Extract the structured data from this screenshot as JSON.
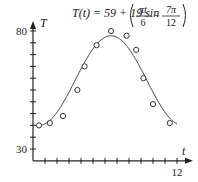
{
  "chart_data": {
    "type": "scatter",
    "title": "",
    "xlabel": "t",
    "ylabel": "T",
    "xlim": [
      0,
      12
    ],
    "ylim": [
      25,
      80
    ],
    "x_ticks_every": 1,
    "y_ticks_every": 5,
    "x_tick_labels": [
      {
        "value": 12,
        "label": "12"
      }
    ],
    "y_tick_labels": [
      {
        "value": 80,
        "label": "80"
      },
      {
        "value": 30,
        "label": "30"
      }
    ],
    "grid": false,
    "annotation": {
      "lhs": "T(t) = 59 + 19 sin",
      "frac1_num": "πt",
      "frac1_den": "6",
      "minus": "−",
      "frac2_num": "7π",
      "frac2_den": "12"
    },
    "model": {
      "A": 59,
      "B": 19,
      "omega_over_pi": 0.16667,
      "phase_over_pi": 0.58333,
      "t_start": 0.5,
      "t_end": 12
    },
    "series": [
      {
        "name": "observed",
        "marker": "open-circle",
        "points": [
          {
            "t": 0.5,
            "T": 40
          },
          {
            "t": 1.4,
            "T": 41
          },
          {
            "t": 2.5,
            "T": 44
          },
          {
            "t": 3.7,
            "T": 55
          },
          {
            "t": 4.3,
            "T": 65
          },
          {
            "t": 5.3,
            "T": 74
          },
          {
            "t": 6.5,
            "T": 80
          },
          {
            "t": 7.8,
            "T": 78
          },
          {
            "t": 8.6,
            "T": 72
          },
          {
            "t": 9.2,
            "T": 60
          },
          {
            "t": 10.0,
            "T": 49
          },
          {
            "t": 11.4,
            "T": 41
          }
        ]
      },
      {
        "name": "T(t) = 59 + 19 sin(πt/6 − 7π/12)",
        "type": "line"
      }
    ]
  }
}
